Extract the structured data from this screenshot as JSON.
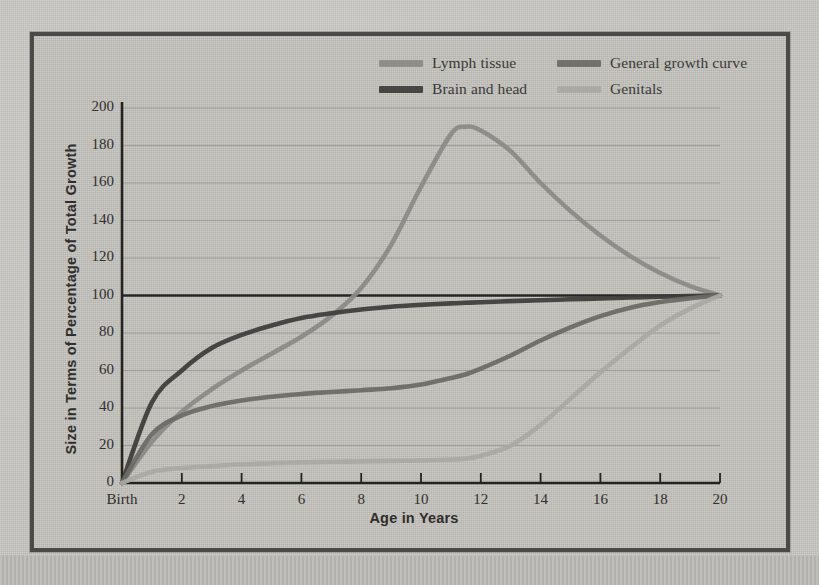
{
  "figure": {
    "legend": {
      "position": "top-right-inside",
      "rows": [
        [
          {
            "label": "Lymph tissue",
            "color": "#8a8a86",
            "series": "lymph"
          },
          {
            "label": "General growth curve",
            "color": "#6a6a66",
            "series": "general"
          }
        ],
        [
          {
            "label": "Brain and head",
            "color": "#3c3c3a",
            "series": "brain"
          },
          {
            "label": "Genitals",
            "color": "#a9a9a4",
            "series": "genitals"
          }
        ]
      ]
    },
    "reference_line": {
      "value": 100,
      "color": "#1e1e1c",
      "label": "100% reference"
    }
  },
  "chart_data": {
    "type": "line",
    "title": "",
    "xlabel": "Age in Years",
    "ylabel": "Size in Terms of Percentage of Total Growth",
    "xlim": [
      0,
      20
    ],
    "ylim": [
      0,
      200
    ],
    "grid": true,
    "grid_axis": "y",
    "legend_position": "top-right",
    "xtick_labels": [
      "Birth",
      "2",
      "4",
      "6",
      "8",
      "10",
      "12",
      "14",
      "16",
      "18",
      "20"
    ],
    "xticks": [
      0,
      2,
      4,
      6,
      8,
      10,
      12,
      14,
      16,
      18,
      20
    ],
    "yticks": [
      0,
      20,
      40,
      60,
      80,
      100,
      120,
      140,
      160,
      180,
      200
    ],
    "x": [
      0,
      1,
      2,
      3,
      4,
      5,
      6,
      7,
      8,
      9,
      10,
      11,
      11.5,
      12,
      13,
      14,
      15,
      16,
      17,
      18,
      19,
      20
    ],
    "series": [
      {
        "name": "Lymph tissue",
        "color": "#8a8a86",
        "values": [
          0,
          22,
          38,
          50,
          60,
          69,
          78,
          89,
          104,
          127,
          158,
          186,
          190,
          188,
          177,
          160,
          145,
          132,
          121,
          112,
          105,
          100
        ]
      },
      {
        "name": "Brain and head",
        "color": "#3c3c3a",
        "values": [
          0,
          43,
          60,
          72,
          79,
          84,
          88,
          90.5,
          92.5,
          94,
          95,
          95.8,
          96.1,
          96.4,
          97,
          97.5,
          98,
          98.4,
          98.9,
          99.3,
          99.7,
          100
        ]
      },
      {
        "name": "General growth curve",
        "color": "#6a6a66",
        "values": [
          0,
          26,
          36,
          41,
          44,
          46,
          47.5,
          48.5,
          49.5,
          50.5,
          52.5,
          56,
          58,
          61,
          68,
          76,
          83,
          89,
          93.5,
          96.5,
          98.5,
          100
        ]
      },
      {
        "name": "Genitals",
        "color": "#a9a9a4",
        "values": [
          0,
          6,
          8,
          9,
          10,
          10.5,
          11,
          11.3,
          11.5,
          11.8,
          12,
          12.5,
          13,
          14.5,
          20,
          31,
          45,
          59,
          72,
          84,
          93,
          100
        ]
      }
    ],
    "annotations": [
      {
        "text": "lymph tissue peaks near 190% at about age 11.5",
        "x": 11.5,
        "y": 190
      },
      {
        "text": "all curves converge at 100% at age 20",
        "x": 20,
        "y": 100
      }
    ]
  }
}
